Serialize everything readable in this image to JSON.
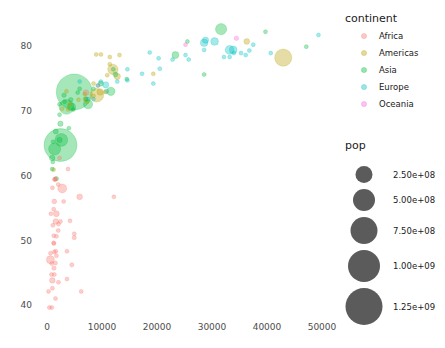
{
  "chart_data": {
    "type": "scatter",
    "title": "",
    "subtitle": "",
    "xlabel": "",
    "ylabel": "",
    "xlim": [
      -2500,
      53000
    ],
    "ylim": [
      38.5,
      83.5
    ],
    "grid": false,
    "x_ticks": [
      0,
      10000,
      20000,
      30000,
      40000,
      50000
    ],
    "x_tick_labels": [
      "0",
      "10000",
      "20000",
      "30000",
      "40000",
      "50000"
    ],
    "y_ticks": [
      40,
      50,
      60,
      70,
      80
    ],
    "y_tick_labels": [
      "40",
      "50",
      "60",
      "70",
      "80"
    ],
    "size_encoding": "pop",
    "color_encoding": "continent",
    "legends": [
      {
        "name": "continent-legend",
        "title": "continent",
        "position": "right-top",
        "entries": [
          {
            "label": "Africa",
            "color": "#f8766d"
          },
          {
            "label": "Americas",
            "color": "#b79f00"
          },
          {
            "label": "Asia",
            "color": "#00ba38"
          },
          {
            "label": "Europe",
            "color": "#00bfc4"
          },
          {
            "label": "Oceania",
            "color": "#f564e3"
          }
        ]
      },
      {
        "name": "pop-legend",
        "title": "pop",
        "position": "right-bottom",
        "swatch_color": "#4d4d4d",
        "entries": [
          {
            "label": "2.50e+08",
            "radius": 8.5
          },
          {
            "label": "5.00e+08",
            "radius": 11.0
          },
          {
            "label": "7.50e+08",
            "radius": 13.5
          },
          {
            "label": "1.00e+09",
            "radius": 16.0
          },
          {
            "label": "1.25e+09",
            "radius": 18.5
          }
        ]
      }
    ],
    "series": [
      {
        "name": "Africa",
        "color": "#f8766d",
        "points": [
          {
            "x": 974,
            "y": 43.8,
            "pop": 31889923
          },
          {
            "x": 5937,
            "y": 56.7,
            "pop": 33333216
          },
          {
            "x": 1217,
            "y": 50.7,
            "pop": 8078314
          },
          {
            "x": 1071,
            "y": 52.3,
            "pop": 1639131
          },
          {
            "x": 1271,
            "y": 49.5,
            "pop": 14326203
          },
          {
            "x": 1713,
            "y": 50.6,
            "pop": 8390505
          },
          {
            "x": 4959,
            "y": 50.4,
            "pop": 17696293
          },
          {
            "x": 823,
            "y": 44.7,
            "pop": 4369038
          },
          {
            "x": 2042,
            "y": 51.5,
            "pop": 10238807
          },
          {
            "x": 3632,
            "y": 48.3,
            "pop": 3800610
          },
          {
            "x": 1544,
            "y": 46.5,
            "pop": 4133884
          },
          {
            "x": 4519,
            "y": 46.2,
            "pop": 18013409
          },
          {
            "x": 1341,
            "y": 44.7,
            "pop": 9119152
          },
          {
            "x": 4959,
            "y": 51.0,
            "pop": 3804000
          },
          {
            "x": 619,
            "y": 47.0,
            "pop": 64606759
          },
          {
            "x": 2082,
            "y": 52.5,
            "pop": 496374
          },
          {
            "x": 12154,
            "y": 56.7,
            "pop": 1454867
          },
          {
            "x": 2773,
            "y": 58.0,
            "pop": 80264543
          },
          {
            "x": 992,
            "y": 58.1,
            "pop": 4906585
          },
          {
            "x": 862,
            "y": 39.6,
            "pop": 1454867
          },
          {
            "x": 1598,
            "y": 48.3,
            "pop": 1688359
          },
          {
            "x": 1327,
            "y": 56.0,
            "pop": 22873338
          },
          {
            "x": 1441,
            "y": 59.4,
            "pop": 9947814
          },
          {
            "x": 706,
            "y": 54.1,
            "pop": 8860588
          },
          {
            "x": 1704,
            "y": 54.1,
            "pop": 35610177
          },
          {
            "x": 986,
            "y": 42.6,
            "pop": 2012649
          },
          {
            "x": 277,
            "y": 42.1,
            "pop": 3193942
          },
          {
            "x": 3632,
            "y": 44.0,
            "pop": 2055080
          },
          {
            "x": 1544,
            "y": 41.0,
            "pop": 12311143
          },
          {
            "x": 430,
            "y": 39.6,
            "pop": 11746035
          },
          {
            "x": 2082,
            "y": 43.5,
            "pop": 1133066
          },
          {
            "x": 1271,
            "y": 45.7,
            "pop": 19951656
          },
          {
            "x": 4184,
            "y": 53.0,
            "pop": 3193942
          },
          {
            "x": 1593,
            "y": 52.9,
            "pop": 31889923
          },
          {
            "x": 863,
            "y": 46.4,
            "pop": 4906585
          },
          {
            "x": 1713,
            "y": 47.6,
            "pop": 13327079
          },
          {
            "x": 7093,
            "y": 72.8,
            "pop": 33333216
          },
          {
            "x": 9269,
            "y": 73.9,
            "pop": 10276158
          },
          {
            "x": 6223,
            "y": 42.1,
            "pop": 12311143
          },
          {
            "x": 2042,
            "y": 58.6,
            "pop": 708573
          },
          {
            "x": 1545,
            "y": 59.5,
            "pop": 1472041
          },
          {
            "x": 3820,
            "y": 61.0,
            "pop": 6426679
          },
          {
            "x": 2280,
            "y": 62.7,
            "pop": 1688359
          },
          {
            "x": 1327,
            "y": 48.2,
            "pop": 5701579
          },
          {
            "x": 1201,
            "y": 49.6,
            "pop": 7483763
          },
          {
            "x": 2441,
            "y": 52.9,
            "pop": 5701579
          },
          {
            "x": 641,
            "y": 48.0,
            "pop": 1639131
          },
          {
            "x": 1217,
            "y": 54.8,
            "pop": 4552198
          },
          {
            "x": 3025,
            "y": 56.0,
            "pop": 2012649
          },
          {
            "x": 1391,
            "y": 59.4,
            "pop": 19167654
          }
        ]
      },
      {
        "name": "Americas",
        "color": "#b79f00",
        "points": [
          {
            "x": 42951,
            "y": 78.2,
            "pop": 301139947
          },
          {
            "x": 36319,
            "y": 80.7,
            "pop": 33390141
          },
          {
            "x": 12779,
            "y": 75.3,
            "pop": 40301927
          },
          {
            "x": 9065,
            "y": 72.4,
            "pop": 190010647
          },
          {
            "x": 13171,
            "y": 78.6,
            "pop": 16284741
          },
          {
            "x": 11978,
            "y": 76.4,
            "pop": 108700891
          },
          {
            "x": 9666,
            "y": 72.9,
            "pop": 44227550
          },
          {
            "x": 7006,
            "y": 71.8,
            "pop": 28674757
          },
          {
            "x": 8948,
            "y": 78.7,
            "pop": 4133884
          },
          {
            "x": 10611,
            "y": 72.9,
            "pop": 3242173
          },
          {
            "x": 11416,
            "y": 78.3,
            "pop": 3331000
          },
          {
            "x": 8458,
            "y": 74.2,
            "pop": 13755680
          },
          {
            "x": 6873,
            "y": 72.6,
            "pop": 6939688
          },
          {
            "x": 5728,
            "y": 71.7,
            "pop": 12572928
          },
          {
            "x": 3822,
            "y": 70.2,
            "pop": 7483763
          },
          {
            "x": 4172,
            "y": 71.0,
            "pop": 8502814
          },
          {
            "x": 1202,
            "y": 60.9,
            "pop": 8502814
          },
          {
            "x": 7320,
            "y": 71.4,
            "pop": 9319622
          },
          {
            "x": 2749,
            "y": 70.3,
            "pop": 5675356
          },
          {
            "x": 3548,
            "y": 73.0,
            "pop": 2780132
          },
          {
            "x": 11416,
            "y": 77.2,
            "pop": 3600523
          },
          {
            "x": 9809,
            "y": 78.7,
            "pop": 11416987
          },
          {
            "x": 19329,
            "y": 75.7,
            "pop": 3942491
          },
          {
            "x": 10957,
            "y": 75.5,
            "pop": 1056608
          },
          {
            "x": 8458,
            "y": 72.3,
            "pop": 2874127
          }
        ]
      },
      {
        "name": "Asia",
        "color": "#00ba38",
        "points": [
          {
            "x": 4959,
            "y": 72.9,
            "pop": 1318683096
          },
          {
            "x": 2452,
            "y": 64.7,
            "pop": 1110396331
          },
          {
            "x": 31656,
            "y": 82.6,
            "pop": 127467972
          },
          {
            "x": 3541,
            "y": 70.6,
            "pop": 223547000
          },
          {
            "x": 2606,
            "y": 65.5,
            "pop": 169270617
          },
          {
            "x": 1391,
            "y": 64.1,
            "pop": 150448339
          },
          {
            "x": 23348,
            "y": 78.6,
            "pop": 49044790
          },
          {
            "x": 11605,
            "y": 73.0,
            "pop": 71158647
          },
          {
            "x": 7458,
            "y": 71.0,
            "pop": 85262356
          },
          {
            "x": 4471,
            "y": 70.6,
            "pop": 65068149
          },
          {
            "x": 12452,
            "y": 75.6,
            "pop": 24821286
          },
          {
            "x": 4326,
            "y": 71.7,
            "pop": 22211743
          },
          {
            "x": 39725,
            "y": 82.2,
            "pop": 6980412
          },
          {
            "x": 47143,
            "y": 79.9,
            "pop": 4553009
          },
          {
            "x": 25523,
            "y": 80.7,
            "pop": 6426679
          },
          {
            "x": 2280,
            "y": 65.5,
            "pop": 28901790
          },
          {
            "x": 3095,
            "y": 72.4,
            "pop": 20378239
          },
          {
            "x": 944,
            "y": 62.7,
            "pop": 31889923
          },
          {
            "x": 1091,
            "y": 65.2,
            "pop": 4115771
          },
          {
            "x": 9786,
            "y": 74.2,
            "pop": 27601038
          },
          {
            "x": 7092,
            "y": 71.8,
            "pop": 6426679
          },
          {
            "x": 4811,
            "y": 70.2,
            "pop": 10150265
          },
          {
            "x": 1593,
            "y": 66.8,
            "pop": 26023100
          },
          {
            "x": 14495,
            "y": 74.9,
            "pop": 4292664
          },
          {
            "x": 28569,
            "y": 75.6,
            "pop": 2505559
          },
          {
            "x": 2280,
            "y": 71.0,
            "pop": 16570613
          },
          {
            "x": 3970,
            "y": 67.3,
            "pop": 5675356
          },
          {
            "x": 5581,
            "y": 72.8,
            "pop": 3600523
          },
          {
            "x": 8458,
            "y": 73.4,
            "pop": 9119152
          },
          {
            "x": 12057,
            "y": 76.4,
            "pop": 1056608
          },
          {
            "x": 2280,
            "y": 69.4,
            "pop": 6426679
          },
          {
            "x": 1056,
            "y": 62.1,
            "pop": 2874127
          },
          {
            "x": 3190,
            "y": 71.4,
            "pop": 8078314
          },
          {
            "x": 5937,
            "y": 73.4,
            "pop": 7554661
          },
          {
            "x": 2441,
            "y": 68.0,
            "pop": 28674757
          },
          {
            "x": 1704,
            "y": 59.5,
            "pop": 20378239
          },
          {
            "x": 944,
            "y": 61.0,
            "pop": 14326203
          }
        ]
      },
      {
        "name": "Europe",
        "color": "#00bfc4",
        "points": [
          {
            "x": 33203,
            "y": 79.4,
            "pop": 82400996
          },
          {
            "x": 30470,
            "y": 80.7,
            "pop": 61083916
          },
          {
            "x": 33860,
            "y": 79.4,
            "pop": 60776238
          },
          {
            "x": 28569,
            "y": 80.5,
            "pop": 58147733
          },
          {
            "x": 28821,
            "y": 80.9,
            "pop": 40448191
          },
          {
            "x": 36797,
            "y": 79.3,
            "pop": 16570613
          },
          {
            "x": 33207,
            "y": 78.3,
            "pop": 10392226
          },
          {
            "x": 35278,
            "y": 78.9,
            "pop": 8199783
          },
          {
            "x": 37506,
            "y": 80.2,
            "pop": 4627926
          },
          {
            "x": 32170,
            "y": 78.3,
            "pop": 5468120
          },
          {
            "x": 33965,
            "y": 78.9,
            "pop": 9031088
          },
          {
            "x": 49357,
            "y": 81.7,
            "pop": 7554661
          },
          {
            "x": 36126,
            "y": 78.6,
            "pop": 4109086
          },
          {
            "x": 40676,
            "y": 78.9,
            "pop": 301931
          },
          {
            "x": 18678,
            "y": 79.0,
            "pop": 10642836
          },
          {
            "x": 10681,
            "y": 74.0,
            "pop": 38518241
          },
          {
            "x": 14619,
            "y": 74.7,
            "pop": 9600783
          },
          {
            "x": 10808,
            "y": 73.0,
            "pop": 22276056
          },
          {
            "x": 9786,
            "y": 74.5,
            "pop": 7322858
          },
          {
            "x": 17282,
            "y": 75.7,
            "pop": 5447502
          },
          {
            "x": 20510,
            "y": 76.5,
            "pop": 2009245
          },
          {
            "x": 20293,
            "y": 78.1,
            "pop": 4493312
          },
          {
            "x": 25768,
            "y": 77.9,
            "pop": 10708232
          },
          {
            "x": 28569,
            "y": 79.4,
            "pop": 796000
          },
          {
            "x": 7446,
            "y": 71.8,
            "pop": 10150265
          },
          {
            "x": 5937,
            "y": 74.5,
            "pop": 4552198
          },
          {
            "x": 9253,
            "y": 73.9,
            "pop": 3600523
          },
          {
            "x": 12779,
            "y": 74.5,
            "pop": 2055080
          },
          {
            "x": 22833,
            "y": 77.9,
            "pop": 9031088
          },
          {
            "x": 25185,
            "y": 78.6,
            "pop": 5238460
          },
          {
            "x": 19329,
            "y": 74.2,
            "pop": 8199783
          },
          {
            "x": 8458,
            "y": 71.8,
            "pop": 4627926
          },
          {
            "x": 14619,
            "y": 76.4,
            "pop": 2009245
          }
        ]
      },
      {
        "name": "Oceania",
        "color": "#f564e3",
        "points": [
          {
            "x": 34435,
            "y": 81.2,
            "pop": 20434176
          },
          {
            "x": 25185,
            "y": 80.2,
            "pop": 4115771
          }
        ]
      }
    ]
  }
}
